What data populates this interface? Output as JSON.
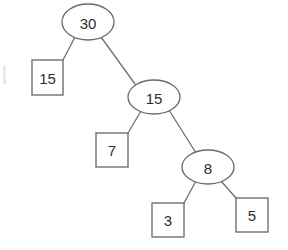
{
  "diagram": {
    "type": "binary-tree",
    "background_color": "#ffffff",
    "stroke_color": "#6f6f6f",
    "text_color": "#2d2d2d",
    "internal_nodes": [
      {
        "id": "root",
        "label": "30",
        "shape": "ellipse",
        "cx": 88,
        "cy": 22,
        "rx": 26,
        "ry": 18
      },
      {
        "id": "n15",
        "label": "15",
        "shape": "ellipse",
        "cx": 154,
        "cy": 97,
        "rx": 26,
        "ry": 17
      },
      {
        "id": "n8",
        "label": "8",
        "shape": "ellipse",
        "cx": 208,
        "cy": 167,
        "rx": 26,
        "ry": 17
      }
    ],
    "leaf_nodes": [
      {
        "id": "leaf15",
        "label": "15",
        "shape": "rect",
        "x": 32,
        "y": 60,
        "w": 31,
        "h": 35
      },
      {
        "id": "leaf7",
        "label": "7",
        "shape": "rect",
        "x": 96,
        "y": 133,
        "w": 32,
        "h": 34
      },
      {
        "id": "leaf3",
        "label": "3",
        "shape": "rect",
        "x": 152,
        "y": 203,
        "w": 32,
        "h": 34
      },
      {
        "id": "leaf5",
        "label": "5",
        "shape": "rect",
        "x": 236,
        "y": 198,
        "w": 32,
        "h": 34
      }
    ],
    "edges": [
      {
        "from": "root",
        "to": "leaf15",
        "x1": 75,
        "y1": 37,
        "x2": 63,
        "y2": 60
      },
      {
        "from": "root",
        "to": "n15",
        "x1": 101,
        "y1": 37,
        "x2": 135,
        "y2": 84
      },
      {
        "from": "n15",
        "to": "leaf7",
        "x1": 141,
        "y1": 111,
        "x2": 128,
        "y2": 133
      },
      {
        "from": "n15",
        "to": "n8",
        "x1": 169,
        "y1": 110,
        "x2": 196,
        "y2": 153
      },
      {
        "from": "n8",
        "to": "leaf3",
        "x1": 196,
        "y1": 181,
        "x2": 184,
        "y2": 203
      },
      {
        "from": "n8",
        "to": "leaf5",
        "x1": 221,
        "y1": 181,
        "x2": 236,
        "y2": 198
      }
    ],
    "values": [
      "30",
      "15",
      "15",
      "7",
      "8",
      "3",
      "5"
    ]
  }
}
